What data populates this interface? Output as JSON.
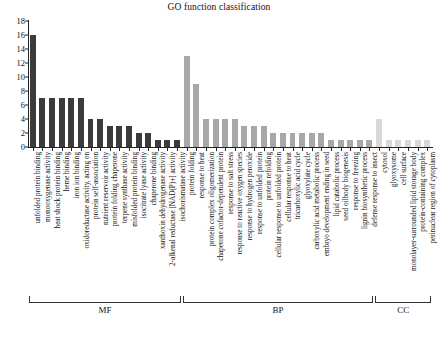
{
  "chart_data": {
    "type": "bar",
    "title": "GO function classification",
    "xlabel": "",
    "ylabel": "",
    "ylim": [
      0,
      18
    ],
    "yticks": [
      0,
      2,
      4,
      6,
      8,
      10,
      12,
      14,
      16,
      18
    ],
    "grid": false,
    "legend": null,
    "group_labels": [
      "MF",
      "BP",
      "CC"
    ],
    "group_colors": [
      "#3b3b3b",
      "#a8a8a8",
      "#d8d8d8"
    ],
    "categories": [
      "unfolded protein binding",
      "monooxygenase activity",
      "heat shock protein binding",
      "heme binding",
      "iron ion binding",
      "oxidoreductase activity, acting on",
      "protein self-association",
      "nutrient reservoir activity",
      "protein folding chaperone",
      "terpene synthase activity",
      "misfolded protein binding",
      "isocitrate lyase activity",
      "chaperone binding",
      "xanthoxin dehydrogenase activity",
      "2-alkenal reductase [NAD(P)+] activity",
      "isochorismatase activity",
      "protein folding",
      "response to heat",
      "protein complex oligomerization",
      "chaperone cofactor-dependent protein",
      "response to salt stress",
      "response to reactive oxygen species",
      "response to hydrogen peroxide",
      "response to unfolded protein",
      "protein refolding",
      "cellular response to unfolded protein",
      "cellular response to heat",
      "tricarboxylic acid cycle",
      "glyoxylate cycle",
      "carboxylic acid metabolic process",
      "embryo development ending in seed",
      "lipid catabolic process",
      "seed oilbody biogenesis",
      "response to freezing",
      "lignin biosynthetic process",
      "defense response to insect",
      "cytosol",
      "glyoxysome",
      "cell surface",
      "monolayer-surrounded lipid storage body",
      "protein-containing complex",
      "perinuclear region of cytoplasm"
    ],
    "values": [
      16,
      7,
      7,
      7,
      7,
      7,
      4,
      4,
      3,
      3,
      3,
      2,
      2,
      1,
      1,
      1,
      13,
      9,
      4,
      4,
      4,
      4,
      3,
      3,
      3,
      2,
      2,
      2,
      2,
      2,
      2,
      1,
      1,
      1,
      1,
      1,
      4,
      1,
      1,
      1,
      1,
      1
    ],
    "groups": [
      {
        "label": "MF",
        "start": 0,
        "end": 15,
        "color": "#3b3b3b"
      },
      {
        "label": "BP",
        "start": 16,
        "end": 35,
        "color": "#a8a8a8"
      },
      {
        "label": "CC",
        "start": 36,
        "end": 41,
        "color": "#d8d8d8"
      }
    ]
  }
}
